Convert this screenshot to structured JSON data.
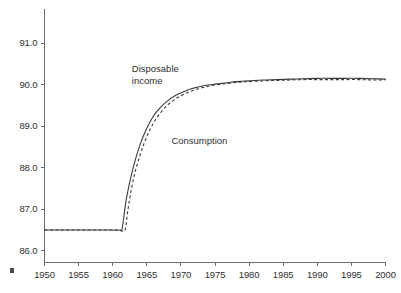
{
  "chart_data": {
    "type": "line",
    "title": "",
    "subtitle": "",
    "xlabel": "",
    "ylabel": "",
    "grid": false,
    "legend_position": "inline-annotations",
    "xlim": [
      1950,
      2000
    ],
    "ylim": [
      85.72,
      91.83
    ],
    "xticks": [
      1950,
      1955,
      1960,
      1965,
      1970,
      1975,
      1980,
      1985,
      1990,
      1995,
      2000
    ],
    "xtick_labels": [
      "1950",
      "1955",
      "1960",
      "1965",
      "1970",
      "1975",
      "1980",
      "1985",
      "1990",
      "1995",
      "2000"
    ],
    "yticks": [
      86.0,
      87.0,
      88.0,
      89.0,
      90.0,
      91.0
    ],
    "ytick_labels": [
      "86.0",
      "87.0",
      "88.0",
      "89.0",
      "90.0",
      "91.0"
    ],
    "annotations": [
      {
        "name": "disposable-income-label",
        "text": "Disposable\nincome",
        "x": 1962.8,
        "y": 90.35
      },
      {
        "name": "consumption-label",
        "text": "Consumption",
        "x": 1968.6,
        "y": 88.62
      }
    ],
    "series": [
      {
        "name": "Disposable income",
        "style": "solid",
        "color": "#3a3a3a",
        "x": [
          1950,
          1952,
          1954,
          1956,
          1958,
          1960,
          1961,
          1961.4,
          1962,
          1963,
          1964,
          1965,
          1966,
          1967,
          1968,
          1969,
          1970,
          1971,
          1972,
          1973,
          1974,
          1975,
          1976,
          1977,
          1978,
          1979,
          1980,
          1982,
          1984,
          1986,
          1988,
          1990,
          1992,
          1994,
          1996,
          1998,
          2000
        ],
        "values": [
          86.5,
          86.5,
          86.5,
          86.5,
          86.5,
          86.5,
          86.5,
          86.55,
          87.25,
          88.0,
          88.55,
          88.95,
          89.25,
          89.45,
          89.6,
          89.72,
          89.8,
          89.87,
          89.92,
          89.96,
          89.99,
          90.01,
          90.03,
          90.05,
          90.07,
          90.08,
          90.09,
          90.11,
          90.12,
          90.13,
          90.14,
          90.15,
          90.15,
          90.15,
          90.15,
          90.14,
          90.13
        ]
      },
      {
        "name": "Consumption",
        "style": "dashed",
        "color": "#3a3a3a",
        "x": [
          1950,
          1952,
          1954,
          1956,
          1958,
          1960,
          1961,
          1961.8,
          1962.2,
          1963,
          1964,
          1965,
          1966,
          1967,
          1968,
          1969,
          1970,
          1971,
          1972,
          1973,
          1974,
          1975,
          1976,
          1977,
          1978,
          1979,
          1980,
          1982,
          1984,
          1986,
          1988,
          1990,
          1992,
          1994,
          1996,
          1998,
          2000
        ],
        "values": [
          86.5,
          86.5,
          86.5,
          86.5,
          86.5,
          86.5,
          86.5,
          86.5,
          86.95,
          87.7,
          88.3,
          88.75,
          89.08,
          89.32,
          89.5,
          89.63,
          89.73,
          89.81,
          89.87,
          89.92,
          89.96,
          89.99,
          90.01,
          90.03,
          90.05,
          90.06,
          90.07,
          90.09,
          90.1,
          90.11,
          90.12,
          90.12,
          90.12,
          90.12,
          90.12,
          90.11,
          90.11
        ]
      }
    ]
  },
  "marks": {
    "corner_artifact": "corner-mark"
  }
}
